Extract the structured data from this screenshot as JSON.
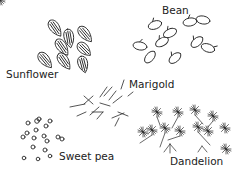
{
  "figure": {
    "title": "",
    "groups": [
      {
        "id": "sunflower",
        "label": "Sunflower",
        "label_pos": [
          6,
          69
        ]
      },
      {
        "id": "bean",
        "label": "Bean",
        "label_pos": [
          162,
          5
        ]
      },
      {
        "id": "marigold",
        "label": "Marigold",
        "label_pos": [
          129,
          79
        ]
      },
      {
        "id": "sweet-pea",
        "label": "Sweet pea",
        "label_pos": [
          59,
          151
        ]
      },
      {
        "id": "dandelion",
        "label": "Dandelion",
        "label_pos": [
          170,
          156
        ]
      }
    ],
    "colors": {
      "ink": "#2a2a2a",
      "background": "#ffffff"
    }
  }
}
